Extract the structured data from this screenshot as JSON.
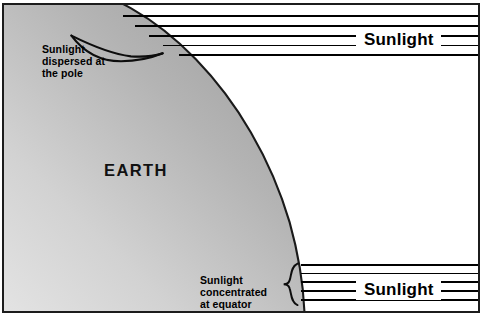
{
  "diagram": {
    "frame": {
      "border_color": "#1c1c1c",
      "background": "#ffffff"
    },
    "earth": {
      "label": "EARTH",
      "shape": "quarter-circle",
      "fill_light": "#d9d9d9",
      "fill_dark": "#9c9c9c",
      "outline_color": "#1a1a1a"
    },
    "annotations": [
      {
        "name": "pole-annotation",
        "text": "Sunlight\ndispersed at\nthe pole",
        "position": "top-left",
        "bracket": "slanted-brace"
      },
      {
        "name": "equator-annotation",
        "text": "Sunlight\nconcentrated\nat equator",
        "position": "bottom-center",
        "bracket": "vertical-brace"
      }
    ],
    "ray_groups": [
      {
        "name": "top-rays",
        "label": "Sunlight",
        "line_count": 5,
        "direction": "horizontal",
        "color": "#000000"
      },
      {
        "name": "bottom-rays",
        "label": "Sunlight",
        "line_count": 5,
        "direction": "horizontal",
        "color": "#000000"
      }
    ]
  }
}
